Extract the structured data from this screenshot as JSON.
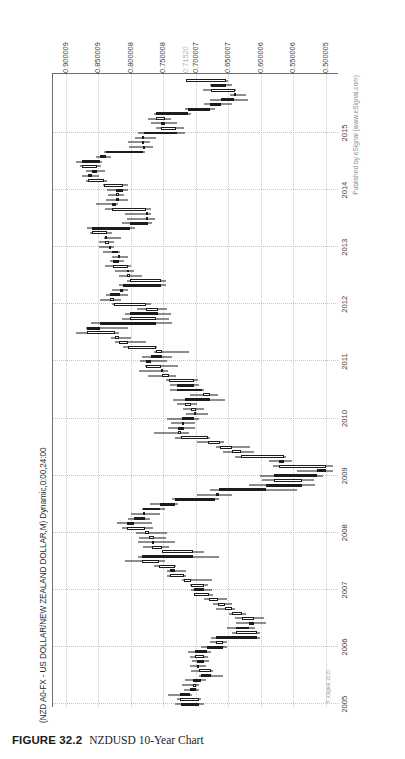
{
  "caption": {
    "figure_number": "FIGURE 32.2",
    "figure_text": "NZDUSD 10-Year Chart"
  },
  "chart": {
    "title": "(NZD A0-FX - US DOLLAR/NEW ZEALAND DOLLAR,M) Dynamic,0:00,24:00",
    "publisher": "Published by eSignal (www.eSignal.com)",
    "copyright": "© eSignal, 2015"
  },
  "chart_data": {
    "type": "candlestick",
    "title": "(NZD A0-FX - US DOLLAR/NEW ZEALAND DOLLAR,M) Dynamic,0:00,24:00",
    "xlabel": "",
    "ylabel": "",
    "grid": true,
    "legend": "none",
    "orientation": "rotated-90-ccw",
    "ylim": [
      0.48,
      0.92
    ],
    "ytick_labels": [
      "0.900009",
      "0.850009",
      "0.800008",
      "0.750008",
      "0.700007",
      "0.650007",
      "0.600006",
      "0.550006",
      "0.500005"
    ],
    "ytick_values": [
      0.900009,
      0.850009,
      0.800008,
      0.750008,
      0.700007,
      0.650007,
      0.600006,
      0.550006,
      0.500005
    ],
    "price_marker": {
      "label": "0.71520",
      "value": 0.7152
    },
    "xtick_labels": [
      "2005",
      "2006",
      "2007",
      "2008",
      "2009",
      "2010",
      "2011",
      "2012",
      "2013",
      "2014",
      "2015"
    ],
    "candles": [
      {
        "t": "2005-01",
        "o": 0.723,
        "h": 0.732,
        "l": 0.688,
        "c": 0.695
      },
      {
        "t": "2005-02",
        "o": 0.695,
        "h": 0.73,
        "l": 0.693,
        "c": 0.725
      },
      {
        "t": "2005-03",
        "o": 0.725,
        "h": 0.743,
        "l": 0.706,
        "c": 0.709
      },
      {
        "t": "2005-04",
        "o": 0.709,
        "h": 0.719,
        "l": 0.696,
        "c": 0.7
      },
      {
        "t": "2005-05",
        "o": 0.7,
        "h": 0.722,
        "l": 0.695,
        "c": 0.705
      },
      {
        "t": "2005-06",
        "o": 0.705,
        "h": 0.717,
        "l": 0.684,
        "c": 0.693
      },
      {
        "t": "2005-07",
        "o": 0.693,
        "h": 0.696,
        "l": 0.658,
        "c": 0.677
      },
      {
        "t": "2005-08",
        "o": 0.677,
        "h": 0.708,
        "l": 0.674,
        "c": 0.696
      },
      {
        "t": "2005-09",
        "o": 0.696,
        "h": 0.71,
        "l": 0.685,
        "c": 0.698
      },
      {
        "t": "2005-10",
        "o": 0.698,
        "h": 0.706,
        "l": 0.68,
        "c": 0.687
      },
      {
        "t": "2005-11",
        "o": 0.687,
        "h": 0.71,
        "l": 0.682,
        "c": 0.702
      },
      {
        "t": "2005-12",
        "o": 0.702,
        "h": 0.712,
        "l": 0.677,
        "c": 0.683
      },
      {
        "t": "2006-01",
        "o": 0.683,
        "h": 0.693,
        "l": 0.652,
        "c": 0.658
      },
      {
        "t": "2006-02",
        "o": 0.658,
        "h": 0.678,
        "l": 0.652,
        "c": 0.67
      },
      {
        "t": "2006-03",
        "o": 0.67,
        "h": 0.677,
        "l": 0.601,
        "c": 0.606
      },
      {
        "t": "2006-04",
        "o": 0.606,
        "h": 0.644,
        "l": 0.602,
        "c": 0.638
      },
      {
        "t": "2006-05",
        "o": 0.638,
        "h": 0.653,
        "l": 0.609,
        "c": 0.618
      },
      {
        "t": "2006-06",
        "o": 0.618,
        "h": 0.638,
        "l": 0.593,
        "c": 0.611
      },
      {
        "t": "2006-07",
        "o": 0.611,
        "h": 0.64,
        "l": 0.596,
        "c": 0.629
      },
      {
        "t": "2006-08",
        "o": 0.629,
        "h": 0.65,
        "l": 0.623,
        "c": 0.644
      },
      {
        "t": "2006-09",
        "o": 0.644,
        "h": 0.67,
        "l": 0.64,
        "c": 0.656
      },
      {
        "t": "2006-10",
        "o": 0.656,
        "h": 0.674,
        "l": 0.644,
        "c": 0.666
      },
      {
        "t": "2006-11",
        "o": 0.666,
        "h": 0.687,
        "l": 0.652,
        "c": 0.68
      },
      {
        "t": "2006-12",
        "o": 0.68,
        "h": 0.7,
        "l": 0.674,
        "c": 0.703
      },
      {
        "t": "2007-01",
        "o": 0.703,
        "h": 0.708,
        "l": 0.675,
        "c": 0.688
      },
      {
        "t": "2007-02",
        "o": 0.688,
        "h": 0.71,
        "l": 0.681,
        "c": 0.707
      },
      {
        "t": "2007-03",
        "o": 0.707,
        "h": 0.722,
        "l": 0.675,
        "c": 0.718
      },
      {
        "t": "2007-04",
        "o": 0.718,
        "h": 0.745,
        "l": 0.716,
        "c": 0.74
      },
      {
        "t": "2007-05",
        "o": 0.74,
        "h": 0.744,
        "l": 0.716,
        "c": 0.733
      },
      {
        "t": "2007-06",
        "o": 0.733,
        "h": 0.764,
        "l": 0.731,
        "c": 0.757
      },
      {
        "t": "2007-07",
        "o": 0.757,
        "h": 0.81,
        "l": 0.748,
        "c": 0.783
      },
      {
        "t": "2007-08",
        "o": 0.783,
        "h": 0.79,
        "l": 0.664,
        "c": 0.705
      },
      {
        "t": "2007-09",
        "o": 0.705,
        "h": 0.753,
        "l": 0.688,
        "c": 0.753
      },
      {
        "t": "2007-10",
        "o": 0.753,
        "h": 0.781,
        "l": 0.742,
        "c": 0.768
      },
      {
        "t": "2007-11",
        "o": 0.768,
        "h": 0.79,
        "l": 0.732,
        "c": 0.764
      },
      {
        "t": "2007-12",
        "o": 0.764,
        "h": 0.788,
        "l": 0.746,
        "c": 0.772
      },
      {
        "t": "2008-01",
        "o": 0.772,
        "h": 0.793,
        "l": 0.744,
        "c": 0.778
      },
      {
        "t": "2008-02",
        "o": 0.778,
        "h": 0.814,
        "l": 0.766,
        "c": 0.806
      },
      {
        "t": "2008-03",
        "o": 0.806,
        "h": 0.822,
        "l": 0.767,
        "c": 0.796
      },
      {
        "t": "2008-04",
        "o": 0.796,
        "h": 0.804,
        "l": 0.77,
        "c": 0.778
      },
      {
        "t": "2008-05",
        "o": 0.778,
        "h": 0.8,
        "l": 0.756,
        "c": 0.782
      },
      {
        "t": "2008-06",
        "o": 0.782,
        "h": 0.783,
        "l": 0.748,
        "c": 0.755
      },
      {
        "t": "2008-07",
        "o": 0.755,
        "h": 0.771,
        "l": 0.728,
        "c": 0.733
      },
      {
        "t": "2008-08",
        "o": 0.733,
        "h": 0.737,
        "l": 0.664,
        "c": 0.67
      },
      {
        "t": "2008-09",
        "o": 0.67,
        "h": 0.698,
        "l": 0.644,
        "c": 0.665
      },
      {
        "t": "2008-10",
        "o": 0.665,
        "h": 0.678,
        "l": 0.545,
        "c": 0.593
      },
      {
        "t": "2008-11",
        "o": 0.593,
        "h": 0.618,
        "l": 0.517,
        "c": 0.537
      },
      {
        "t": "2008-12",
        "o": 0.537,
        "h": 0.598,
        "l": 0.518,
        "c": 0.58
      },
      {
        "t": "2009-01",
        "o": 0.58,
        "h": 0.602,
        "l": 0.505,
        "c": 0.514
      },
      {
        "t": "2009-02",
        "o": 0.514,
        "h": 0.545,
        "l": 0.49,
        "c": 0.5
      },
      {
        "t": "2009-03",
        "o": 0.5,
        "h": 0.581,
        "l": 0.489,
        "c": 0.572
      },
      {
        "t": "2009-04",
        "o": 0.572,
        "h": 0.588,
        "l": 0.552,
        "c": 0.565
      },
      {
        "t": "2009-05",
        "o": 0.565,
        "h": 0.64,
        "l": 0.561,
        "c": 0.631
      },
      {
        "t": "2009-06",
        "o": 0.631,
        "h": 0.659,
        "l": 0.611,
        "c": 0.645
      },
      {
        "t": "2009-07",
        "o": 0.645,
        "h": 0.669,
        "l": 0.617,
        "c": 0.663
      },
      {
        "t": "2009-08",
        "o": 0.663,
        "h": 0.698,
        "l": 0.657,
        "c": 0.682
      },
      {
        "t": "2009-09",
        "o": 0.682,
        "h": 0.732,
        "l": 0.678,
        "c": 0.723
      },
      {
        "t": "2009-10",
        "o": 0.723,
        "h": 0.764,
        "l": 0.71,
        "c": 0.728
      },
      {
        "t": "2009-11",
        "o": 0.728,
        "h": 0.743,
        "l": 0.702,
        "c": 0.719
      },
      {
        "t": "2009-12",
        "o": 0.719,
        "h": 0.739,
        "l": 0.701,
        "c": 0.722
      },
      {
        "t": "2010-01",
        "o": 0.722,
        "h": 0.744,
        "l": 0.695,
        "c": 0.703
      },
      {
        "t": "2010-02",
        "o": 0.703,
        "h": 0.715,
        "l": 0.682,
        "c": 0.7
      },
      {
        "t": "2010-03",
        "o": 0.7,
        "h": 0.72,
        "l": 0.688,
        "c": 0.707
      },
      {
        "t": "2010-04",
        "o": 0.707,
        "h": 0.729,
        "l": 0.699,
        "c": 0.717
      },
      {
        "t": "2010-05",
        "o": 0.717,
        "h": 0.735,
        "l": 0.656,
        "c": 0.678
      },
      {
        "t": "2010-06",
        "o": 0.678,
        "h": 0.709,
        "l": 0.666,
        "c": 0.69
      },
      {
        "t": "2010-07",
        "o": 0.69,
        "h": 0.74,
        "l": 0.687,
        "c": 0.729
      },
      {
        "t": "2010-08",
        "o": 0.729,
        "h": 0.74,
        "l": 0.696,
        "c": 0.703
      },
      {
        "t": "2010-09",
        "o": 0.703,
        "h": 0.746,
        "l": 0.697,
        "c": 0.742
      },
      {
        "t": "2010-10",
        "o": 0.742,
        "h": 0.774,
        "l": 0.73,
        "c": 0.752
      },
      {
        "t": "2010-11",
        "o": 0.752,
        "h": 0.787,
        "l": 0.743,
        "c": 0.754
      },
      {
        "t": "2010-12",
        "o": 0.754,
        "h": 0.779,
        "l": 0.728,
        "c": 0.777
      },
      {
        "t": "2011-01",
        "o": 0.777,
        "h": 0.786,
        "l": 0.745,
        "c": 0.769
      },
      {
        "t": "2011-02",
        "o": 0.769,
        "h": 0.783,
        "l": 0.737,
        "c": 0.753
      },
      {
        "t": "2011-03",
        "o": 0.753,
        "h": 0.765,
        "l": 0.711,
        "c": 0.762
      },
      {
        "t": "2011-04",
        "o": 0.762,
        "h": 0.812,
        "l": 0.76,
        "c": 0.805
      },
      {
        "t": "2011-05",
        "o": 0.805,
        "h": 0.825,
        "l": 0.777,
        "c": 0.819
      },
      {
        "t": "2011-06",
        "o": 0.819,
        "h": 0.831,
        "l": 0.8,
        "c": 0.825
      },
      {
        "t": "2011-07",
        "o": 0.825,
        "h": 0.884,
        "l": 0.819,
        "c": 0.867
      },
      {
        "t": "2011-08",
        "o": 0.867,
        "h": 0.87,
        "l": 0.805,
        "c": 0.848
      },
      {
        "t": "2011-09",
        "o": 0.848,
        "h": 0.861,
        "l": 0.737,
        "c": 0.762
      },
      {
        "t": "2011-10",
        "o": 0.762,
        "h": 0.814,
        "l": 0.741,
        "c": 0.801
      },
      {
        "t": "2011-11",
        "o": 0.801,
        "h": 0.809,
        "l": 0.738,
        "c": 0.759
      },
      {
        "t": "2011-12",
        "o": 0.759,
        "h": 0.791,
        "l": 0.744,
        "c": 0.777
      },
      {
        "t": "2012-01",
        "o": 0.777,
        "h": 0.83,
        "l": 0.769,
        "c": 0.826
      },
      {
        "t": "2012-02",
        "o": 0.826,
        "h": 0.847,
        "l": 0.816,
        "c": 0.833
      },
      {
        "t": "2012-03",
        "o": 0.833,
        "h": 0.838,
        "l": 0.805,
        "c": 0.817
      },
      {
        "t": "2012-04",
        "o": 0.817,
        "h": 0.83,
        "l": 0.804,
        "c": 0.813
      },
      {
        "t": "2012-05",
        "o": 0.813,
        "h": 0.819,
        "l": 0.746,
        "c": 0.754
      },
      {
        "t": "2012-06",
        "o": 0.754,
        "h": 0.806,
        "l": 0.746,
        "c": 0.802
      },
      {
        "t": "2012-07",
        "o": 0.802,
        "h": 0.818,
        "l": 0.783,
        "c": 0.806
      },
      {
        "t": "2012-08",
        "o": 0.806,
        "h": 0.825,
        "l": 0.796,
        "c": 0.805
      },
      {
        "t": "2012-09",
        "o": 0.805,
        "h": 0.84,
        "l": 0.8,
        "c": 0.827
      },
      {
        "t": "2012-10",
        "o": 0.827,
        "h": 0.832,
        "l": 0.811,
        "c": 0.819
      },
      {
        "t": "2012-11",
        "o": 0.819,
        "h": 0.83,
        "l": 0.804,
        "c": 0.82
      },
      {
        "t": "2012-12",
        "o": 0.82,
        "h": 0.843,
        "l": 0.817,
        "c": 0.83
      },
      {
        "t": "2013-01",
        "o": 0.83,
        "h": 0.85,
        "l": 0.826,
        "c": 0.834
      },
      {
        "t": "2013-02",
        "o": 0.834,
        "h": 0.849,
        "l": 0.826,
        "c": 0.84
      },
      {
        "t": "2013-03",
        "o": 0.84,
        "h": 0.842,
        "l": 0.815,
        "c": 0.837
      },
      {
        "t": "2013-04",
        "o": 0.837,
        "h": 0.863,
        "l": 0.829,
        "c": 0.86
      },
      {
        "t": "2013-05",
        "o": 0.86,
        "h": 0.867,
        "l": 0.794,
        "c": 0.801
      },
      {
        "t": "2013-06",
        "o": 0.801,
        "h": 0.814,
        "l": 0.768,
        "c": 0.774
      },
      {
        "t": "2013-07",
        "o": 0.774,
        "h": 0.806,
        "l": 0.763,
        "c": 0.777
      },
      {
        "t": "2013-08",
        "o": 0.777,
        "h": 0.81,
        "l": 0.77,
        "c": 0.777
      },
      {
        "t": "2013-09",
        "o": 0.777,
        "h": 0.84,
        "l": 0.769,
        "c": 0.829
      },
      {
        "t": "2013-10",
        "o": 0.829,
        "h": 0.854,
        "l": 0.82,
        "c": 0.823
      },
      {
        "t": "2013-11",
        "o": 0.823,
        "h": 0.839,
        "l": 0.805,
        "c": 0.818
      },
      {
        "t": "2013-12",
        "o": 0.818,
        "h": 0.836,
        "l": 0.81,
        "c": 0.823
      },
      {
        "t": "2014-01",
        "o": 0.823,
        "h": 0.837,
        "l": 0.805,
        "c": 0.813
      },
      {
        "t": "2014-02",
        "o": 0.813,
        "h": 0.843,
        "l": 0.805,
        "c": 0.841
      },
      {
        "t": "2014-03",
        "o": 0.841,
        "h": 0.87,
        "l": 0.837,
        "c": 0.866
      },
      {
        "t": "2014-04",
        "o": 0.866,
        "h": 0.875,
        "l": 0.849,
        "c": 0.86
      },
      {
        "t": "2014-05",
        "o": 0.86,
        "h": 0.87,
        "l": 0.84,
        "c": 0.852
      },
      {
        "t": "2014-06",
        "o": 0.852,
        "h": 0.879,
        "l": 0.846,
        "c": 0.876
      },
      {
        "t": "2014-07",
        "o": 0.876,
        "h": 0.884,
        "l": 0.844,
        "c": 0.847
      },
      {
        "t": "2014-08",
        "o": 0.847,
        "h": 0.854,
        "l": 0.831,
        "c": 0.839
      },
      {
        "t": "2014-09",
        "o": 0.839,
        "h": 0.842,
        "l": 0.778,
        "c": 0.781
      },
      {
        "t": "2014-10",
        "o": 0.781,
        "h": 0.803,
        "l": 0.766,
        "c": 0.781
      },
      {
        "t": "2014-11",
        "o": 0.781,
        "h": 0.804,
        "l": 0.77,
        "c": 0.783
      },
      {
        "t": "2014-12",
        "o": 0.783,
        "h": 0.794,
        "l": 0.761,
        "c": 0.78
      },
      {
        "t": "2015-01",
        "o": 0.78,
        "h": 0.789,
        "l": 0.717,
        "c": 0.73
      },
      {
        "t": "2015-02",
        "o": 0.73,
        "h": 0.762,
        "l": 0.718,
        "c": 0.754
      },
      {
        "t": "2015-03",
        "o": 0.754,
        "h": 0.77,
        "l": 0.73,
        "c": 0.748
      },
      {
        "t": "2015-04",
        "o": 0.748,
        "h": 0.774,
        "l": 0.739,
        "c": 0.762
      },
      {
        "t": "2015-05",
        "o": 0.762,
        "h": 0.764,
        "l": 0.707,
        "c": 0.713
      },
      {
        "t": "2015-06",
        "o": 0.713,
        "h": 0.717,
        "l": 0.67,
        "c": 0.679
      },
      {
        "t": "2015-07",
        "o": 0.679,
        "h": 0.687,
        "l": 0.645,
        "c": 0.662
      },
      {
        "t": "2015-08",
        "o": 0.662,
        "h": 0.678,
        "l": 0.62,
        "c": 0.642
      },
      {
        "t": "2015-09",
        "o": 0.642,
        "h": 0.648,
        "l": 0.623,
        "c": 0.64
      },
      {
        "t": "2015-10",
        "o": 0.64,
        "h": 0.689,
        "l": 0.638,
        "c": 0.677
      },
      {
        "t": "2015-11",
        "o": 0.677,
        "h": 0.678,
        "l": 0.645,
        "c": 0.654
      },
      {
        "t": "2015-12",
        "o": 0.654,
        "h": 0.716,
        "l": 0.651,
        "c": 0.7152
      }
    ]
  }
}
